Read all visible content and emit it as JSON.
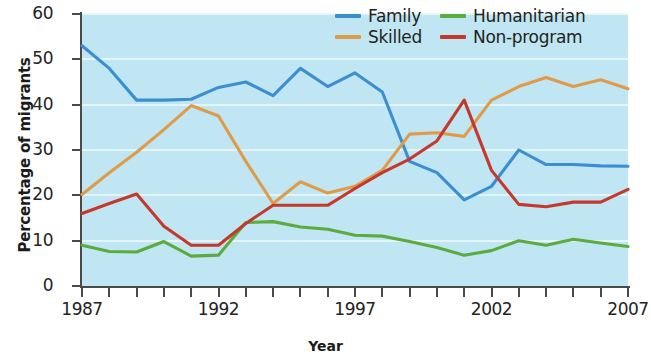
{
  "chart_data": {
    "type": "line",
    "title": "",
    "xlabel": "Year",
    "ylabel": "Percentage of migrants",
    "xlim": [
      1987,
      2007
    ],
    "ylim": [
      0,
      60
    ],
    "ytick_values": [
      0,
      10,
      20,
      30,
      40,
      50,
      60
    ],
    "ytick_labels": [
      "0",
      "10",
      "20",
      "30",
      "40",
      "50",
      "60"
    ],
    "xtick_values": [
      1987,
      1988,
      1989,
      1990,
      1991,
      1992,
      1993,
      1994,
      1995,
      1996,
      1997,
      1998,
      1999,
      2000,
      2001,
      2002,
      2003,
      2004,
      2005,
      2006,
      2007
    ],
    "xtick_labels_shown": [
      "1987",
      "1992",
      "1997",
      "2002",
      "2007"
    ],
    "xtick_labels_shown_values": [
      1987,
      1992,
      1997,
      2002,
      2007
    ],
    "grid": true,
    "grid_axis": "y",
    "legend_position": "top-right",
    "plot_background": "#bfe6f2",
    "x": [
      1987,
      1988,
      1989,
      1990,
      1991,
      1992,
      1993,
      1994,
      1995,
      1996,
      1997,
      1998,
      1999,
      2000,
      2001,
      2002,
      2003,
      2004,
      2005,
      2006,
      2007
    ],
    "series": [
      {
        "name": "Family",
        "color": "#3b8fd0",
        "values": [
          53.0,
          48.0,
          41.0,
          41.0,
          41.2,
          43.8,
          45.0,
          42.0,
          48.0,
          44.0,
          47.0,
          42.8,
          27.5,
          25.0,
          19.0,
          22.0,
          30.0,
          26.8,
          26.8,
          26.5,
          26.4
        ]
      },
      {
        "name": "Skilled",
        "color": "#e09b4a",
        "values": [
          20.2,
          25.0,
          29.5,
          34.5,
          39.8,
          37.5,
          27.5,
          18.2,
          23.0,
          20.5,
          22.0,
          25.5,
          33.5,
          33.8,
          33.0,
          41.0,
          44.0,
          46.0,
          44.0,
          45.5,
          43.5
        ]
      },
      {
        "name": "Humanitarian",
        "color": "#5cab3e",
        "values": [
          9.0,
          7.6,
          7.5,
          9.8,
          6.6,
          6.8,
          14.0,
          14.2,
          13.0,
          12.5,
          11.2,
          11.0,
          9.8,
          8.5,
          6.8,
          7.8,
          10.0,
          9.0,
          10.3,
          9.5,
          8.7
        ]
      },
      {
        "name": "Non-program",
        "color": "#c4392b",
        "values": [
          16.0,
          18.2,
          20.3,
          13.2,
          9.0,
          9.0,
          13.8,
          17.8,
          17.8,
          17.8,
          21.5,
          25.0,
          28.0,
          32.0,
          41.0,
          25.5,
          18.0,
          17.5,
          18.5,
          18.5,
          21.3
        ]
      }
    ],
    "legend": [
      {
        "label": "Family",
        "color": "#3b8fd0"
      },
      {
        "label": "Humanitarian",
        "color": "#5cab3e"
      },
      {
        "label": "Skilled",
        "color": "#e09b4a"
      },
      {
        "label": "Non-program",
        "color": "#c4392b"
      }
    ]
  }
}
